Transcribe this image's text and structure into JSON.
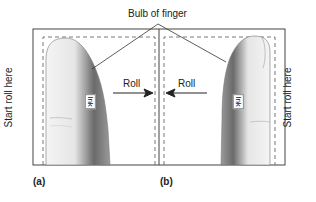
{
  "title_label": "Bulb of finger",
  "left_panel": {
    "side_label": "Start roll here",
    "ink_label": "Ink",
    "roll_label": "Roll",
    "panel_label": "(a)",
    "roll_direction": "right"
  },
  "right_panel": {
    "side_label": "Start roll here",
    "ink_label": "Ink",
    "roll_label": "Roll",
    "panel_label": "(b)",
    "roll_direction": "left"
  },
  "colors": {
    "line": "#333333",
    "finger_light": "#efefef",
    "finger_dark": "#5a5a5a"
  }
}
